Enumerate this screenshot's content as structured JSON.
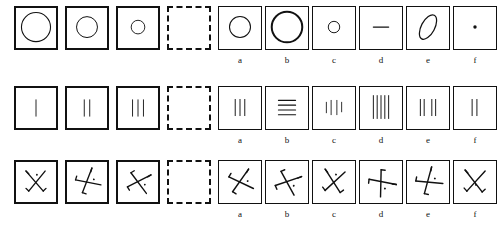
{
  "test": {
    "type": "non-verbal-matrix-reasoning",
    "rows_count": 3,
    "problems_per_row": 4,
    "options_per_row": 6,
    "blank_cell_style": "dashed"
  },
  "option_labels": [
    "a",
    "b",
    "c",
    "d",
    "e",
    "f"
  ],
  "colors": {
    "ink": "#111111",
    "paper": "#ffffff"
  },
  "rows": [
    {
      "id": "row-1",
      "theme": "circles-decreasing-size",
      "problem_cells": [
        {
          "id": "r1p1",
          "shape": "circle",
          "size": "large",
          "stroke": 1.2,
          "blank": false
        },
        {
          "id": "r1p2",
          "shape": "circle",
          "size": "medium",
          "stroke": 1.0,
          "blank": false
        },
        {
          "id": "r1p3",
          "shape": "circle",
          "size": "small",
          "stroke": 1.0,
          "blank": false
        },
        {
          "id": "r1p4",
          "shape": "blank",
          "size": "none",
          "stroke": 0,
          "blank": true
        }
      ],
      "option_cells": [
        {
          "id": "r1oa",
          "label": "a",
          "shape": "circle",
          "size": "medium",
          "stroke": 1.0
        },
        {
          "id": "r1ob",
          "label": "b",
          "shape": "circle",
          "size": "xlarge",
          "stroke": 2.0
        },
        {
          "id": "r1oc",
          "label": "c",
          "shape": "circle",
          "size": "xsmall",
          "stroke": 1.0
        },
        {
          "id": "r1od",
          "label": "d",
          "shape": "horizontal-line",
          "size": "short",
          "stroke": 1.2
        },
        {
          "id": "r1oe",
          "label": "e",
          "shape": "tilted-ellipse",
          "size": "medium",
          "stroke": 1.2
        },
        {
          "id": "r1of",
          "label": "f",
          "shape": "dot",
          "size": "tiny",
          "stroke": 0
        }
      ]
    },
    {
      "id": "row-2",
      "theme": "vertical-tally-marks-increasing",
      "problem_cells": [
        {
          "id": "r2p1",
          "shape": "vertical-lines",
          "count": 1,
          "orientation": "vertical",
          "blank": false
        },
        {
          "id": "r2p2",
          "shape": "vertical-lines",
          "count": 2,
          "orientation": "vertical",
          "blank": false
        },
        {
          "id": "r2p3",
          "shape": "vertical-lines",
          "count": 3,
          "orientation": "vertical",
          "blank": false
        },
        {
          "id": "r2p4",
          "shape": "blank",
          "count": 0,
          "orientation": "none",
          "blank": true
        }
      ],
      "option_cells": [
        {
          "id": "r2oa",
          "label": "a",
          "shape": "vertical-lines",
          "count": 3,
          "orientation": "vertical",
          "variant": "even"
        },
        {
          "id": "r2ob",
          "label": "b",
          "shape": "horizontal-lines",
          "count": 4,
          "orientation": "horizontal",
          "variant": "stacked"
        },
        {
          "id": "r2oc",
          "label": "c",
          "shape": "vertical-lines",
          "count": 4,
          "orientation": "vertical",
          "variant": "uneven-short"
        },
        {
          "id": "r2od",
          "label": "d",
          "shape": "vertical-lines",
          "count": 5,
          "orientation": "vertical",
          "variant": "tall"
        },
        {
          "id": "r2oe",
          "label": "e",
          "shape": "vertical-lines",
          "count": 4,
          "orientation": "vertical",
          "variant": "grouped"
        },
        {
          "id": "r2of",
          "label": "f",
          "shape": "vertical-lines",
          "count": 2,
          "orientation": "vertical",
          "variant": "even"
        }
      ]
    },
    {
      "id": "row-3",
      "theme": "rotating-crossed-strokes-with-dot",
      "problem_cells": [
        {
          "id": "r3p1",
          "shape": "crossed-strokes",
          "rotation": 0,
          "blank": false
        },
        {
          "id": "r3p2",
          "shape": "crossed-strokes",
          "rotation": 60,
          "blank": false
        },
        {
          "id": "r3p3",
          "shape": "crossed-strokes",
          "rotation": 100,
          "blank": false
        },
        {
          "id": "r3p4",
          "shape": "blank",
          "rotation": 0,
          "blank": true
        }
      ],
      "option_cells": [
        {
          "id": "r3oa",
          "label": "a",
          "shape": "crossed-strokes",
          "rotation": 75
        },
        {
          "id": "r3ob",
          "label": "b",
          "shape": "crossed-strokes",
          "rotation": 110
        },
        {
          "id": "r3oc",
          "label": "c",
          "shape": "crossed-strokes",
          "rotation": 10
        },
        {
          "id": "r3od",
          "label": "d",
          "shape": "crossed-strokes",
          "rotation": 140
        },
        {
          "id": "r3oe",
          "label": "e",
          "shape": "crossed-strokes",
          "rotation": 55
        },
        {
          "id": "r3of",
          "label": "f",
          "shape": "crossed-strokes",
          "rotation": 5
        }
      ]
    }
  ]
}
